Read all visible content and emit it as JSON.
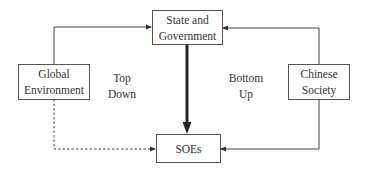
{
  "diagram": {
    "nodes": {
      "state": {
        "line1": "State and",
        "line2": "Government"
      },
      "soes": {
        "line1": "SOEs"
      },
      "global": {
        "line1": "Global",
        "line2": "Environment"
      },
      "society": {
        "line1": "Chinese",
        "line2": "Society"
      }
    },
    "labels": {
      "top_down": {
        "line1": "Top",
        "line2": "Down"
      },
      "bottom_up": {
        "line1": "Bottom",
        "line2": "Up"
      }
    },
    "edges": [
      {
        "from": "Global Environment",
        "to": "State and Government",
        "style": "solid"
      },
      {
        "from": "Chinese Society",
        "to": "State and Government",
        "style": "solid"
      },
      {
        "from": "State and Government",
        "to": "SOEs",
        "style": "thick"
      },
      {
        "from": "Global Environment",
        "to": "SOEs",
        "style": "dashed"
      },
      {
        "from": "Chinese Society",
        "to": "SOEs",
        "style": "solid"
      }
    ],
    "colors": {
      "stroke": "#333333",
      "text": "#333333",
      "background": "#ffffff"
    }
  }
}
